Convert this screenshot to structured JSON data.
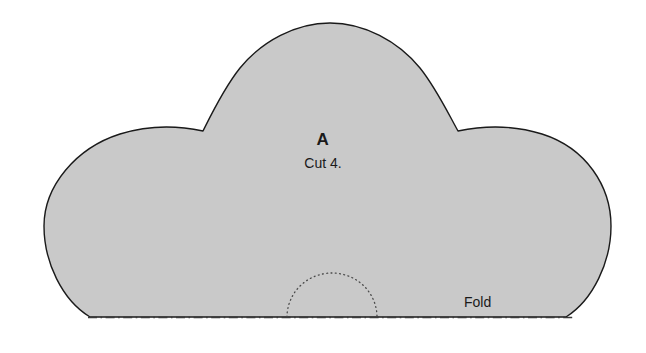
{
  "document": {
    "type": "sewing-pattern-piece",
    "background_color": "#ffffff"
  },
  "pattern": {
    "piece_label": "A",
    "cut_instruction": "Cut 4.",
    "fold_label": "Fold",
    "fill_color": "#c9c9c9",
    "outline_color": "#1a1a1a",
    "outline_width": 1.4,
    "fold_line_color": "#3a3a3a",
    "dotted_arc_color": "#4a4a4a",
    "shape_outline": "M 90 317 C 62 300 44 262 44 226 C 44 186 76 148 120 134 C 152 124 180 126 203 131 C 212 113 224 88 240 68 C 262 41 296 23 330 23 C 364 23 398 41 420 68 C 436 88 448 113 458 131 C 482 126 510 124 542 134 C 586 148 611 186 611 226 C 611 262 593 300 566 317 Z",
    "fold_line": {
      "x1": 88,
      "y1": 317.5,
      "x2": 575,
      "y2": 317.5
    },
    "dotted_arc": {
      "cx": 332,
      "cy": 317,
      "rx": 45,
      "ry": 44
    },
    "notches": [
      {
        "name": "left-notch",
        "x": 203,
        "y": 131
      },
      {
        "name": "right-notch",
        "x": 458,
        "y": 131
      }
    ]
  }
}
